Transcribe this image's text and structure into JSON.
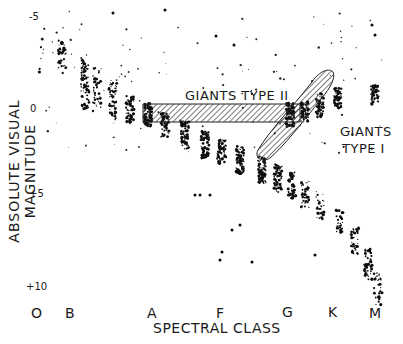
{
  "chart_data": {
    "type": "scatter",
    "title": "",
    "xlabel": "SPECTRAL CLASS",
    "ylabel": "ABSOLUTE VISUAL MAGNITUDE",
    "categories": [
      "O",
      "B",
      "A",
      "F",
      "G",
      "K",
      "M"
    ],
    "y_ticks": [
      "-5",
      "0",
      "+5",
      "+10"
    ],
    "ylim": [
      10,
      -5
    ],
    "grid": false,
    "legend": null,
    "annotations": [
      "GIANTS TYPE II",
      "GIANTS TYPE I"
    ],
    "series": [
      {
        "name": "Main sequence",
        "x": [
          "B",
          "B",
          "A",
          "A",
          "F",
          "F",
          "G",
          "G",
          "K",
          "K",
          "M",
          "M"
        ],
        "y": [
          -3,
          -1.5,
          0,
          1,
          2,
          2.5,
          3.5,
          4.5,
          6,
          7,
          9,
          10
        ]
      },
      {
        "name": "Giants Type II",
        "x": [
          "A",
          "F",
          "G"
        ],
        "y": [
          0.5,
          0.5,
          0.5
        ]
      },
      {
        "name": "Giants Type I",
        "x": [
          "G",
          "K",
          "M"
        ],
        "y": [
          2,
          0,
          -2
        ]
      }
    ]
  },
  "axis": {
    "y_label": "ABSOLUTE VISUAL MAGNITUDE",
    "x_label": "SPECTRAL CLASS",
    "y_ticks": [
      {
        "label": "-5",
        "y": 18
      },
      {
        "label": "0",
        "y": 110
      },
      {
        "label": "+5",
        "y": 200
      },
      {
        "label": "+10",
        "y": 286
      }
    ],
    "x_classes": [
      {
        "label": "O",
        "x": 37
      },
      {
        "label": "B",
        "x": 70
      },
      {
        "label": "A",
        "x": 152
      },
      {
        "label": "F",
        "x": 220
      },
      {
        "label": "G",
        "x": 286
      },
      {
        "label": "K",
        "x": 333
      },
      {
        "label": "M",
        "x": 375
      }
    ]
  },
  "annotations": {
    "giants_type_ii": "GIANTS TYPE II",
    "giants_type_i_line1": "GIANTS",
    "giants_type_i_line2": "TYPE I"
  }
}
